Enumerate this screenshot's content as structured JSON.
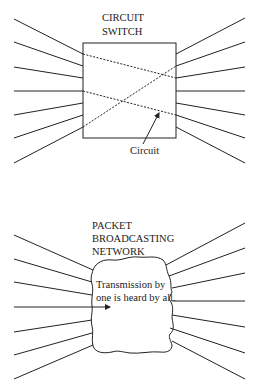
{
  "circuit_switch": {
    "title_line1": "CIRCUIT",
    "title_line2": "SWITCH",
    "circuit_label": "Circuit",
    "ports_per_side": 7,
    "connections": 2
  },
  "packet_network": {
    "title_line1": "PACKET",
    "title_line2": "BROADCASTING",
    "title_line3": "NETWORK",
    "caption_line1": "Transmission by",
    "caption_line2": "one is heard by all.",
    "ports_per_side": 7
  },
  "colors": {
    "stroke": "#222222",
    "background": "#ffffff"
  }
}
